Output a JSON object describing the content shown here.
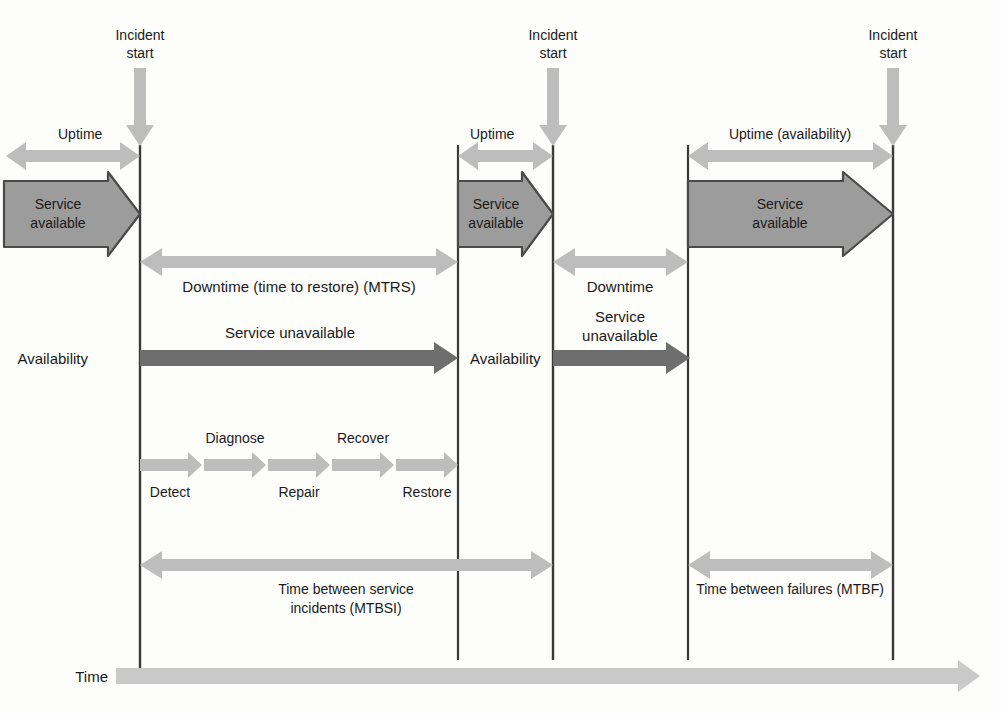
{
  "figure": {
    "background_color": "#fdfdfc",
    "colors": {
      "light_gray_arrow": "#b8b8b8",
      "mid_gray_fill": "#9c9c9c",
      "dark_gray_arrow": "#6e6e6e",
      "outline": "#4a4a4a",
      "axis_line": "#3a3a3a",
      "text": "#1a1a1a",
      "time_axis": "#c9c9c9"
    }
  },
  "incident_markers": [
    {
      "id": "incident-1",
      "line1": "Incident",
      "line2": "start",
      "x": 140
    },
    {
      "id": "incident-2",
      "line1": "Incident",
      "line2": "start",
      "x": 553
    },
    {
      "id": "incident-3",
      "line1": "Incident",
      "line2": "start",
      "x": 893
    }
  ],
  "row_labels": {
    "availability_left": "Availability",
    "availability_mid": "Availability",
    "time_axis": "Time"
  },
  "segments": {
    "first_cycle": {
      "uptime_label": "Uptime",
      "service_available_line1": "Service",
      "service_available_line2": "available",
      "downtime_label": "Downtime (time to restore) (MTRS)",
      "service_unavailable_label": "Service unavailable",
      "mtbsi_line1": "Time between service",
      "mtbsi_line2": "incidents (MTBSI)"
    },
    "second_cycle": {
      "uptime_label": "Uptime",
      "service_available_line1": "Service",
      "service_available_line2": "available",
      "downtime_label": "Downtime",
      "service_unavailable_line1": "Service",
      "service_unavailable_line2": "unavailable"
    },
    "third_cycle": {
      "uptime_label": "Uptime (availability)",
      "service_available_line1": "Service",
      "service_available_line2": "available",
      "mtbf_label": "Time between failures (MTBF)"
    }
  },
  "restoration_stages": [
    {
      "label": "Detect",
      "position": "below"
    },
    {
      "label": "Diagnose",
      "position": "above"
    },
    {
      "label": "Repair",
      "position": "below"
    },
    {
      "label": "Recover",
      "position": "above"
    },
    {
      "label": "Restore",
      "position": "below"
    }
  ]
}
